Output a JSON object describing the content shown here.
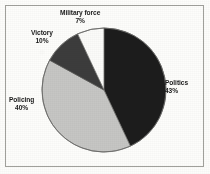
{
  "figure": {
    "border_color": "#9a9a95",
    "background": "#fdfdfb"
  },
  "chart_data": {
    "type": "pie",
    "title": "",
    "subtitle": "",
    "xlabel": "",
    "ylabel": "",
    "grid": false,
    "legend_position": "none",
    "labels_outside": true,
    "start_angle_deg": 0,
    "direction": "clockwise",
    "center": {
      "x": 104,
      "y": 90
    },
    "radius": 62,
    "categories": [
      "Politics",
      "Policing",
      "Victory",
      "Military force"
    ],
    "values": [
      43,
      40,
      10,
      7
    ],
    "units": "percent",
    "total": 100,
    "colors": [
      "#1c1c1c",
      "#c6c6c4",
      "#3c3c3c",
      "#fbfbf9"
    ],
    "slices": [
      {
        "label": "Politics",
        "value": 43,
        "value_text": "43%",
        "color": "#1c1c1c",
        "start_angle_deg": 0,
        "end_angle_deg": 154.8
      },
      {
        "label": "Policing",
        "value": 40,
        "value_text": "40%",
        "color": "#c6c6c4",
        "start_angle_deg": 154.8,
        "end_angle_deg": 298.8
      },
      {
        "label": "Victory",
        "value": 10,
        "value_text": "10%",
        "color": "#3c3c3c",
        "start_angle_deg": 298.8,
        "end_angle_deg": 334.8
      },
      {
        "label": "Military force",
        "value": 7,
        "value_text": "7%",
        "color": "#fbfbf9",
        "start_angle_deg": 334.8,
        "end_angle_deg": 360
      }
    ]
  },
  "labels": {
    "military": {
      "name": "Military force",
      "pct": "7%"
    },
    "victory": {
      "name": "Victory",
      "pct": "10%"
    },
    "policing": {
      "name": "Policing",
      "pct": "40%"
    },
    "politics": {
      "name": "Politics",
      "pct": "43%"
    }
  }
}
